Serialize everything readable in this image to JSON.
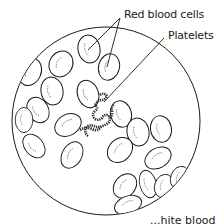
{
  "diagram": {
    "labels": {
      "red_blood_cells": "Red blood cells",
      "platelets": "Platelets",
      "cut_off_bottom": "...hite blood cells"
    },
    "colors": {
      "stroke": "#1a1a1a",
      "background": "#ffffff"
    },
    "field": {
      "cx": 106,
      "cy": 121,
      "r": 94
    }
  }
}
